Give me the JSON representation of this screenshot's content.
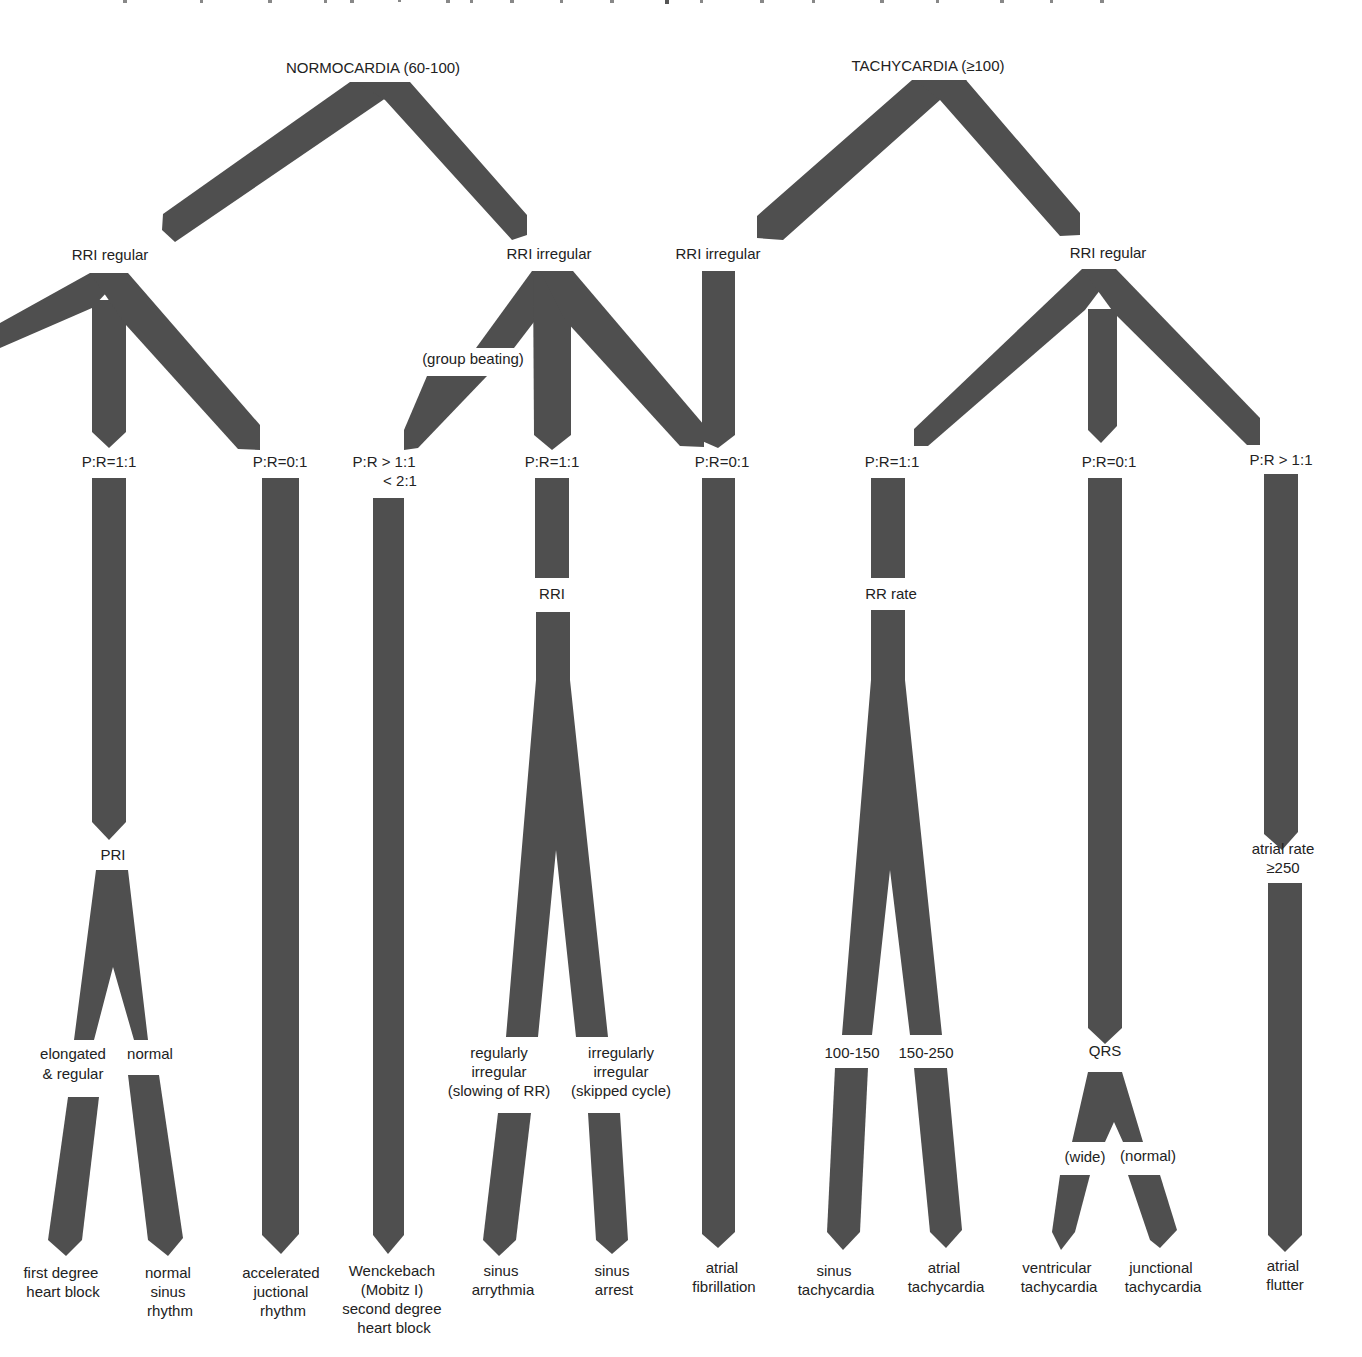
{
  "colors": {
    "bar": "#4f4f4f",
    "text": "#222222",
    "background": "#ffffff"
  },
  "roots": {
    "normocardia": "NORMOCARDIA (60-100)",
    "tachycardia": "TACHYCARDIA (≥100)"
  },
  "level2": {
    "normo_rri_regular": "RRI regular",
    "normo_rri_irregular": "RRI irregular",
    "tachy_rri_irregular": "RRI irregular",
    "tachy_rri_regular": "RRI regular"
  },
  "annotations": {
    "group_beating": "(group beating)"
  },
  "level3": {
    "pr_1_1_a": "P:R=1:1",
    "pr_0_1_a": "P:R=0:1",
    "pr_gt_line1": "P:R > 1:1",
    "pr_gt_line2": "< 2:1",
    "pr_1_1_b": "P:R=1:1",
    "pr_0_1_b": "P:R=0:1",
    "pr_1_1_c": "P:R=1:1",
    "pr_0_1_c": "P:R=0:1",
    "pr_gt_c": "P:R > 1:1"
  },
  "level4": {
    "pri": "PRI",
    "rri": "RRI",
    "rr_rate": "RR rate",
    "qrs": "QRS",
    "atrial_rate_line1": "atrial rate",
    "atrial_rate_line2": "≥250"
  },
  "level5": {
    "elongated_line1": "elongated",
    "elongated_line2": "& regular",
    "normal": "normal",
    "reg_irr_line1": "regularly",
    "reg_irr_line2": "irregular",
    "reg_irr_line3": "(slowing of RR)",
    "irr_irr_line1": "irregularly",
    "irr_irr_line2": "irregular",
    "irr_irr_line3": "(skipped cycle)",
    "rate_100_150": "100-150",
    "rate_150_250": "150-250",
    "wide": "(wide)",
    "normal_qrs": "(normal)"
  },
  "outcomes": [
    {
      "id": "first-degree-heart-block",
      "lines": [
        "first degree",
        "heart block"
      ]
    },
    {
      "id": "normal-sinus-rhythm",
      "lines": [
        "normal",
        "sinus",
        "rhythm"
      ]
    },
    {
      "id": "accelerated-junctional-rhythm",
      "lines": [
        "accelerated",
        "juctional",
        "rhythm"
      ]
    },
    {
      "id": "wenckebach",
      "lines": [
        "Wenckebach",
        "(Mobitz I)",
        "second degree",
        "heart block"
      ]
    },
    {
      "id": "sinus-arrythmia",
      "lines": [
        "sinus",
        "arrythmia"
      ]
    },
    {
      "id": "sinus-arrest",
      "lines": [
        "sinus",
        "arrest"
      ]
    },
    {
      "id": "atrial-fibrillation",
      "lines": [
        "atrial",
        "fibrillation"
      ]
    },
    {
      "id": "sinus-tachycardia",
      "lines": [
        "sinus",
        "tachycardia"
      ]
    },
    {
      "id": "atrial-tachycardia",
      "lines": [
        "atrial",
        "tachycardia"
      ]
    },
    {
      "id": "ventricular-tachycardia",
      "lines": [
        "ventricular",
        "tachycardia"
      ]
    },
    {
      "id": "junctional-tachycardia",
      "lines": [
        "junctional",
        "tachycardia"
      ]
    },
    {
      "id": "atrial-flutter",
      "lines": [
        "atrial",
        "flutter"
      ]
    }
  ]
}
